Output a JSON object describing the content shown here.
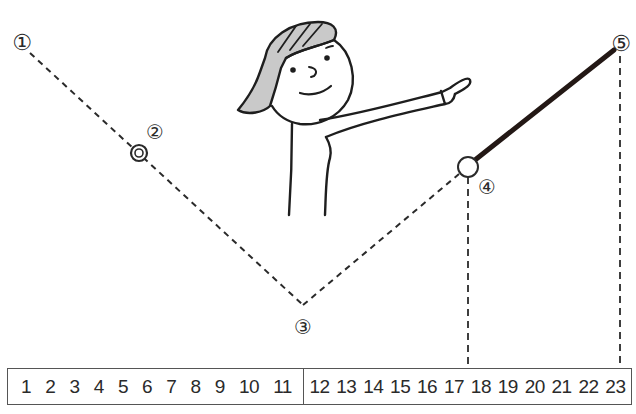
{
  "diagram": {
    "points": [
      {
        "id": "1",
        "label": "①",
        "x": 30,
        "y": 52,
        "label_x": 22,
        "label_y": 42,
        "marker": "none"
      },
      {
        "id": "2",
        "label": "②",
        "x": 139,
        "y": 153,
        "label_x": 155,
        "label_y": 131,
        "marker": "double-circle"
      },
      {
        "id": "3",
        "label": "③",
        "x": 303,
        "y": 305,
        "label_x": 303,
        "label_y": 326,
        "marker": "none"
      },
      {
        "id": "4",
        "label": "④",
        "x": 468,
        "y": 167,
        "label_x": 487,
        "label_y": 186,
        "marker": "open-circle"
      },
      {
        "id": "5",
        "label": "⑤",
        "x": 614,
        "y": 50,
        "label_x": 621,
        "label_y": 43,
        "marker": "none"
      }
    ],
    "segments": [
      {
        "from": "1",
        "to": "3",
        "style": "dashed"
      },
      {
        "from": "3",
        "to": "4",
        "style": "dashed"
      },
      {
        "from": "4",
        "to": "5",
        "style": "thick-solid"
      }
    ],
    "drop_lines": [
      {
        "from_point": "4",
        "x": 468,
        "to_number": "18",
        "style": "dashed"
      },
      {
        "from_point": "5",
        "x": 620,
        "to_number": "23",
        "style": "dashed"
      }
    ],
    "figure": {
      "description": "girl with gray hair pointing to the right",
      "hair_color": "#c8c8c8"
    },
    "colors": {
      "line": "#2a2a2a",
      "thick_line": "#231815",
      "hair": "#c9c9c9"
    }
  },
  "number_line": {
    "left": [
      "1",
      "2",
      "3",
      "4",
      "5",
      "6",
      "7",
      "8",
      "9",
      "10",
      "11"
    ],
    "right": [
      "12",
      "13",
      "14",
      "15",
      "16",
      "17",
      "18",
      "19",
      "20",
      "21",
      "22",
      "23"
    ]
  }
}
